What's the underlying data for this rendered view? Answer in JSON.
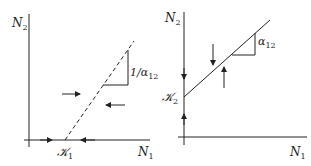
{
  "panels": [
    {
      "id": "left",
      "y_axis_label": "N",
      "y_axis_sub": "2",
      "x_axis_label": "N",
      "x_axis_sub": "1",
      "intercept_label": "𝒦",
      "intercept_sub": "1",
      "slope_label": "1/α",
      "slope_sub": "12",
      "line_style": "dashed"
    },
    {
      "id": "right",
      "y_axis_label": "N",
      "y_axis_sub": "2",
      "x_axis_label": "N",
      "x_axis_sub": "1",
      "intercept_label": "𝒦",
      "intercept_sub": "2",
      "slope_label": "α",
      "slope_sub": "12",
      "line_style": "solid"
    }
  ],
  "colors": {
    "ink": "#222222",
    "background": "#ffffff"
  }
}
